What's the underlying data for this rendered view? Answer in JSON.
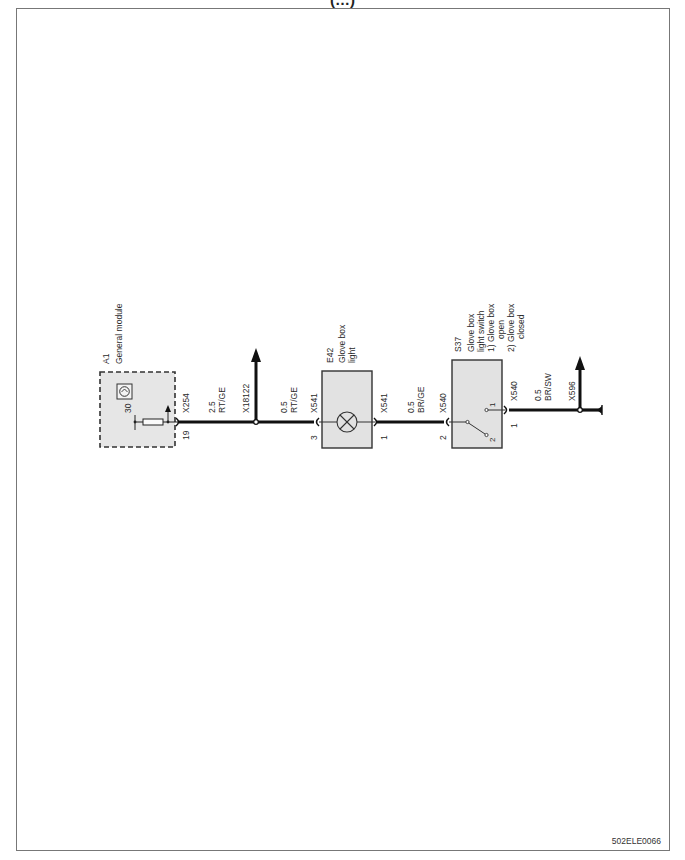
{
  "page": {
    "title_partial": "(…)",
    "document_id": "502ELE0066"
  },
  "components": {
    "a1": {
      "ref": "A1",
      "name": "General module",
      "pin_label": "30",
      "connector": "X254",
      "pin": "19"
    },
    "e42": {
      "ref": "E42",
      "name_line1": "Glove box",
      "name_line2": "light",
      "connector_in": "X541",
      "pin_in": "3",
      "connector_out": "X541",
      "pin_out": "1"
    },
    "s37": {
      "ref": "S37",
      "name_line1": "Glove box",
      "name_line2": "light switch",
      "state1_line1": "1) Glove box",
      "state1_line2": "open",
      "state2_line1": "2) Glove box",
      "state2_line2": "closed",
      "connector_in": "X540",
      "pin_in": "2",
      "connector_out": "X540",
      "pin_out": "1",
      "contact1": "1",
      "contact2": "2"
    }
  },
  "wires": [
    {
      "id": "w1",
      "gauge": "2.5",
      "color": "RT/GE"
    },
    {
      "id": "w2",
      "gauge": "0.5",
      "color": "RT/GE"
    },
    {
      "id": "w3",
      "gauge": "0.5",
      "color": "BR/GE"
    },
    {
      "id": "w4",
      "gauge": "0.5",
      "color": "BR/SW"
    }
  ],
  "splices": [
    {
      "id": "X18122"
    },
    {
      "id": "X596"
    }
  ]
}
